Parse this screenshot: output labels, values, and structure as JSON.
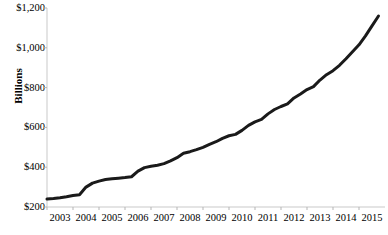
{
  "chart_data": {
    "type": "line",
    "title": "",
    "subtitle": "",
    "xlabel": "",
    "ylabel": "Billions",
    "xlim": [
      2003.0,
      2016.0
    ],
    "ylim": [
      200,
      1200
    ],
    "grid": false,
    "legend": null,
    "y_ticks": [
      200,
      400,
      600,
      800,
      1000,
      1200
    ],
    "y_tick_labels": [
      "$200",
      "$400",
      "$600",
      "$800",
      "$1,000",
      "$1,200"
    ],
    "x_ticks": [
      2003,
      2004,
      2005,
      2006,
      2007,
      2008,
      2009,
      2010,
      2011,
      2012,
      2013,
      2014,
      2015
    ],
    "x_tick_labels": [
      "2003",
      "2004",
      "2005",
      "2006",
      "2007",
      "2008",
      "2009",
      "2010",
      "2011",
      "2012",
      "2013",
      "2014",
      "2015"
    ],
    "series": [
      {
        "name": "Total",
        "color": "#1a1a1a",
        "line_width": 3,
        "x": [
          2003.0,
          2003.25,
          2003.5,
          2003.75,
          2004.0,
          2004.25,
          2004.5,
          2004.75,
          2005.0,
          2005.25,
          2005.5,
          2005.75,
          2006.0,
          2006.25,
          2006.5,
          2006.75,
          2007.0,
          2007.25,
          2007.5,
          2007.75,
          2008.0,
          2008.25,
          2008.5,
          2008.75,
          2009.0,
          2009.25,
          2009.5,
          2009.75,
          2010.0,
          2010.25,
          2010.5,
          2010.75,
          2011.0,
          2011.25,
          2011.5,
          2011.75,
          2012.0,
          2012.25,
          2012.5,
          2012.75,
          2013.0,
          2013.25,
          2013.5,
          2013.75,
          2014.0,
          2014.25,
          2014.5,
          2014.75,
          2015.0,
          2015.25,
          2015.5,
          2015.75
        ],
        "values": [
          240,
          243,
          247,
          252,
          258,
          262,
          300,
          320,
          330,
          338,
          342,
          345,
          348,
          352,
          380,
          398,
          405,
          410,
          418,
          432,
          448,
          470,
          478,
          488,
          500,
          515,
          528,
          545,
          558,
          565,
          585,
          610,
          628,
          640,
          668,
          690,
          705,
          718,
          748,
          768,
          790,
          805,
          838,
          865,
          885,
          912,
          945,
          980,
          1015,
          1060,
          1110,
          1160
        ]
      }
    ],
    "annotations": []
  },
  "axes": {
    "axis_color": "#c9c9c9",
    "tick_color": "#b5b5b5",
    "text_color": "#000000"
  }
}
